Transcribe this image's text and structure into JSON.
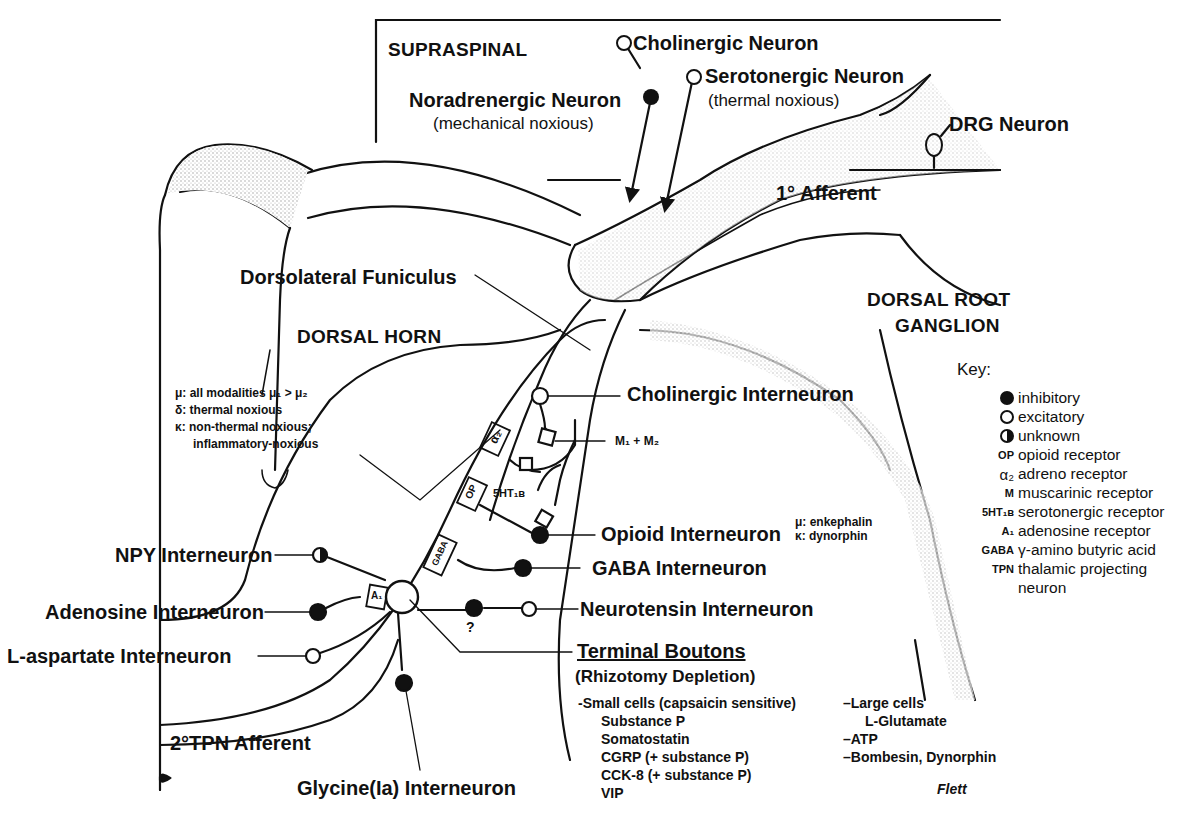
{
  "regions": {
    "supraspinal": "SUPRASPINAL",
    "dorsal_horn": "DORSAL HORN",
    "dorsal_root_ganglion_line1": "DORSAL ROOT",
    "dorsal_root_ganglion_line2": "GANGLION",
    "dorsolateral_funiculus": "Dorsolateral Funiculus",
    "primary_afferent": "1° Afferent",
    "secondary_afferent": "2°TPN Afferent"
  },
  "supraspinal_neurons": {
    "cholinergic": "Cholinergic Neuron",
    "serotonergic": "Serotonergic Neuron",
    "serotonergic_note": "(thermal noxious)",
    "noradrenergic": "Noradrenergic Neuron",
    "noradrenergic_note": "(mechanical noxious)",
    "drg": "DRG Neuron"
  },
  "interneurons": {
    "cholinergic": "Cholinergic Interneuron",
    "muscarinic_label": "M₁ + M₂",
    "opioid": "Opioid Interneuron",
    "opioid_mu": "μ: enkephalin",
    "opioid_kappa": "κ: dynorphin",
    "gaba": "GABA Interneuron",
    "neurotensin": "Neurotensin Interneuron",
    "npy": "NPY Interneuron",
    "adenosine": "Adenosine Interneuron",
    "l_aspartate": "L-aspartate Interneuron",
    "glycine": "Glycine(Ia) Interneuron",
    "unknown_mark": "?"
  },
  "receptor_boxes": {
    "alpha2": "α₂",
    "op": "OP",
    "gaba": "GABA",
    "a1": "A₁",
    "sht1b": "5HT₁ʙ"
  },
  "opioid_modalities": [
    "μ: all modalities μ₁ > μ₂",
    "δ: thermal noxious",
    "κ: non-thermal noxious;",
    "inflammatory-noxious"
  ],
  "terminal_boutons": {
    "title": "Terminal Boutons",
    "subtitle": "(Rhizotomy Depletion)",
    "small_cells": [
      "-Small cells (capsaicin sensitive)",
      "Substance P",
      "Somatostatin",
      "CGRP (+ substance P)",
      "CCK-8 (+ substance P)",
      "VIP"
    ],
    "large_cells": [
      "–Large cells",
      "L-Glutamate",
      "–ATP",
      "–Bombesin, Dynorphin"
    ]
  },
  "legend": {
    "title": "Key:",
    "items": [
      {
        "symbol": "filled-circle",
        "label": "inhibitory"
      },
      {
        "symbol": "open-circle",
        "label": "excitatory"
      },
      {
        "symbol": "half-circle",
        "label": "unknown"
      },
      {
        "symbol": "OP",
        "label": "opioid receptor"
      },
      {
        "symbol": "α₂",
        "label": "adreno receptor"
      },
      {
        "symbol": "M",
        "label": "muscarinic receptor"
      },
      {
        "symbol": "5HT₁ʙ",
        "label": "serotonergic receptor"
      },
      {
        "symbol": "A₁",
        "label": "adenosine receptor"
      },
      {
        "symbol": "GABA",
        "label": "γ-amino butyric acid"
      },
      {
        "symbol": "TPN",
        "label": "thalamic projecting"
      },
      {
        "symbol": "",
        "label": "neuron"
      }
    ]
  },
  "signature": "Flett",
  "colors": {
    "ink": "#111111",
    "paper": "#ffffff",
    "stipple": "#bdbdbd"
  }
}
